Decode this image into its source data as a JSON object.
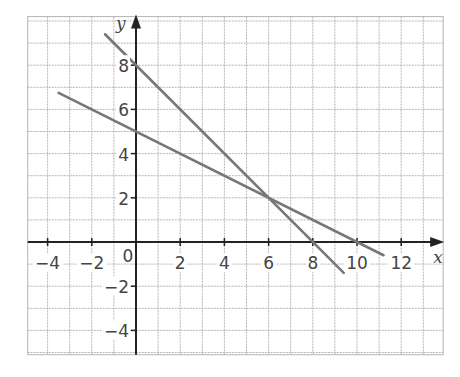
{
  "chart_data": {
    "type": "line",
    "title": "",
    "xlabel": "x",
    "ylabel": "y",
    "xlim": [
      -4.9,
      13.9
    ],
    "ylim": [
      -5.1,
      10.2
    ],
    "grid": true,
    "grid_step": 1,
    "x_ticks": [
      -4,
      -2,
      0,
      2,
      4,
      6,
      8,
      10,
      12
    ],
    "y_ticks": [
      -4,
      -2,
      2,
      4,
      6,
      8
    ],
    "x_tick_labels": [
      "−4",
      "−2",
      "0",
      "2",
      "4",
      "6",
      "8",
      "10",
      "12"
    ],
    "y_tick_labels": [
      "−4",
      "−2",
      "2",
      "4",
      "6",
      "8"
    ],
    "origin_label": "0",
    "series": [
      {
        "name": "line 1 (y = 8 − x)",
        "color": "#777777",
        "points": [
          [
            -1.4,
            9.4
          ],
          [
            0,
            8
          ],
          [
            6,
            2
          ],
          [
            8,
            0
          ],
          [
            9.4,
            -1.4
          ]
        ]
      },
      {
        "name": "line 2 (y = 5 − x/2)",
        "color": "#777777",
        "points": [
          [
            -3.5,
            6.75
          ],
          [
            0,
            5
          ],
          [
            6,
            2
          ],
          [
            10,
            0
          ],
          [
            11.2,
            -0.6
          ]
        ]
      }
    ],
    "intersection": [
      6,
      2
    ]
  },
  "colors": {
    "grid": "#b5b5b5",
    "axis": "#222222",
    "line": "#777777",
    "text": "#444444"
  }
}
